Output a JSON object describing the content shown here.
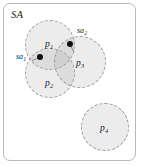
{
  "figure": {
    "width": 142,
    "height": 166,
    "background_color": "#ffffff",
    "border_color": "#b9b9b9",
    "circle_fill_color": "#a0a0a0",
    "circle_border_color": "#9a9a9a",
    "point_color": "#101010",
    "text_color": "#1a1a1a"
  },
  "service_area": {
    "label": "SA"
  },
  "regions": [
    {
      "id": "p1",
      "label_base": "p",
      "label_sub": "1",
      "cx": 50,
      "cy": 45,
      "r": 25,
      "label_x": 45,
      "label_y": 40
    },
    {
      "id": "p2",
      "label_base": "p",
      "label_sub": "2",
      "cx": 50,
      "cy": 73,
      "r": 25,
      "label_x": 45,
      "label_y": 79
    },
    {
      "id": "p3",
      "label_base": "p",
      "label_sub": "3",
      "cx": 80,
      "cy": 62,
      "r": 26,
      "label_x": 76,
      "label_y": 59
    },
    {
      "id": "p4",
      "label_base": "p",
      "label_sub": "4",
      "cx": 105,
      "cy": 127,
      "r": 24,
      "label_x": 100,
      "label_y": 124
    }
  ],
  "access_points": [
    {
      "id": "sa1",
      "label_base": "sa",
      "label_sub": "1",
      "x": 40,
      "y": 57,
      "label_x": 16,
      "label_y": 53,
      "leader_len": 9,
      "leader_angle": 22
    },
    {
      "id": "sa2",
      "label_base": "sa",
      "label_sub": "2",
      "x": 70,
      "y": 44,
      "label_x": 77,
      "label_y": 27,
      "leader_len": 9,
      "leader_angle": 118
    }
  ]
}
